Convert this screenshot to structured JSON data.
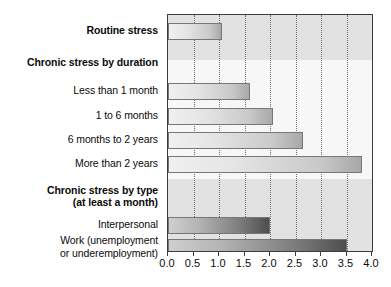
{
  "chart_data": {
    "type": "bar",
    "orientation": "horizontal",
    "title": "",
    "subtitle": "",
    "xlabel": "",
    "ylabel": "",
    "xlim": [
      0.0,
      4.0
    ],
    "grid": true,
    "legend": false,
    "xticks": [
      "0.0",
      "0.5",
      "1.0",
      "1.5",
      "2.0",
      "2.5",
      "3.0",
      "3.5",
      "4.0"
    ],
    "xtick_values": [
      0.0,
      0.5,
      1.0,
      1.5,
      2.0,
      2.5,
      3.0,
      3.5,
      4.0
    ],
    "categories": [
      "Routine stress",
      "Chronic stress by duration",
      "Less than 1 month",
      "1 to 6 months",
      "6 months to 2 years",
      "More than 2 years",
      "Chronic stress by type\n(at least a month)",
      "Interpersonal",
      "Work (unemployment\nor underemployment)"
    ],
    "values": [
      1.05,
      null,
      1.6,
      2.05,
      2.65,
      3.8,
      null,
      2.0,
      3.5
    ],
    "rows": [
      {
        "label": "Routine stress",
        "value": 1.05,
        "bold": true,
        "header": false,
        "style": "pale",
        "band": "dark"
      },
      {
        "label": "Chronic stress by duration",
        "value": null,
        "bold": true,
        "header": true,
        "style": "pale",
        "band": "light"
      },
      {
        "label": "Less than 1 month",
        "value": 1.6,
        "bold": false,
        "header": false,
        "style": "pale",
        "band": "light"
      },
      {
        "label": "1 to 6 months",
        "value": 2.05,
        "bold": false,
        "header": false,
        "style": "pale",
        "band": "light"
      },
      {
        "label": "6 months to 2 years",
        "value": 2.65,
        "bold": false,
        "header": false,
        "style": "pale",
        "band": "light"
      },
      {
        "label": "More than 2 years",
        "value": 3.8,
        "bold": false,
        "header": false,
        "style": "pale",
        "band": "light"
      },
      {
        "label": "Chronic stress by type\n(at least a month)",
        "value": null,
        "bold": true,
        "header": true,
        "style": "dark",
        "band": "dark"
      },
      {
        "label": "Interpersonal",
        "value": 2.0,
        "bold": false,
        "header": false,
        "style": "dark",
        "band": "dark"
      },
      {
        "label": "Work (unemployment\nor underemployment)",
        "value": 3.5,
        "bold": false,
        "header": false,
        "style": "dark",
        "band": "dark"
      }
    ],
    "colors": {
      "plot_background": "#f4f4f4",
      "band_dark": "#e2e2e2",
      "band_light": "#f7f7f7",
      "bar_border": "#777777",
      "axis": "#3d3d3d",
      "gridline": "#6f6f6f",
      "text": "#0b0b0b"
    }
  }
}
